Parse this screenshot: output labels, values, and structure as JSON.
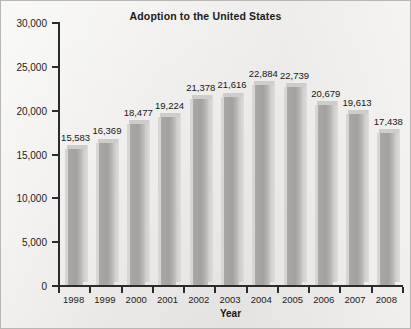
{
  "chart_data": {
    "type": "bar",
    "title": "Adoption to the United States",
    "xlabel": "Year",
    "ylabel": "",
    "categories": [
      "1998",
      "1999",
      "2000",
      "2001",
      "2002",
      "2003",
      "2004",
      "2005",
      "2006",
      "2007",
      "2008"
    ],
    "values": [
      15583,
      16369,
      18477,
      19224,
      21378,
      21616,
      22884,
      22739,
      20679,
      19613,
      17438
    ],
    "value_labels": [
      "15,583",
      "16,369",
      "18,477",
      "19,224",
      "21,378",
      "21,616",
      "22,884",
      "22,739",
      "20,679",
      "19,613",
      "17,438"
    ],
    "ylim": [
      0,
      30000
    ],
    "ytick_values": [
      0,
      5000,
      10000,
      15000,
      20000,
      25000,
      30000
    ],
    "ytick_labels": [
      "0",
      "5,000",
      "10,000",
      "15,000",
      "20,000",
      "25,000",
      "30,000"
    ],
    "grid": false,
    "legend": null,
    "bar_color": "#a9a8a6",
    "background_color": "#efeeec",
    "axis_color": "#2b2b2b",
    "text_color": "#1b1b1b"
  }
}
